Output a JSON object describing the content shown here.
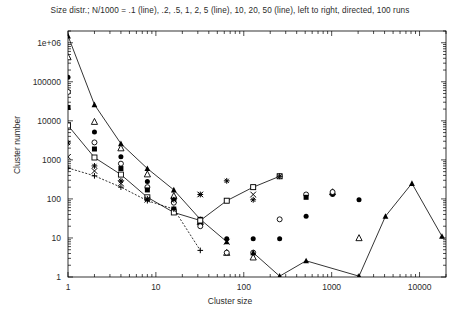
{
  "chart_data": {
    "type": "scatter",
    "title": "Size distr.; N/1000 = .1 (line), .2, .5, 1, 2, 5 (line), 10, 20, 50 (line), left to right, directed, 100 runs",
    "xlabel": "Cluster size",
    "ylabel": "Cluster number",
    "xscale": "log",
    "yscale": "log",
    "xlim": [
      1,
      20000
    ],
    "ylim": [
      1,
      2000000
    ],
    "xticks": [
      "1",
      "10",
      "100",
      "1000",
      "10000"
    ],
    "xtick_values": [
      1,
      10,
      100,
      1000,
      10000
    ],
    "yticks": [
      "1",
      "10",
      "100",
      "1000",
      "10000",
      "100000",
      "1e+06"
    ],
    "ytick_values": [
      1,
      10,
      100,
      1000,
      10000,
      100000,
      1000000
    ],
    "grid": false,
    "legend": "none",
    "note": "9 series; N/1000 = .1, .2, .5, 1, 2, 5, 10, 20, 50; series .1, 5 and 50 are drawn with connecting lines",
    "series": [
      {
        "name": ".1",
        "label": "N/1000 = .1",
        "marker": "filled-triangle",
        "line": true,
        "linestyle": "solid",
        "x": [
          1,
          2,
          4,
          8,
          16,
          32,
          64
        ],
        "y": [
          1500000,
          26000,
          2600,
          600,
          170,
          30,
          8
        ]
      },
      {
        "name": ".2",
        "label": "N/1000 = .2",
        "marker": "open-triangle",
        "line": false,
        "x": [
          1,
          2,
          4,
          8,
          16,
          32,
          64,
          128,
          1024,
          2048
        ],
        "y": [
          430000,
          9500,
          2000,
          430,
          120,
          26,
          4.2,
          3.2,
          150,
          10
        ]
      },
      {
        "name": ".5",
        "label": "N/1000 = .5",
        "marker": "filled-circle",
        "line": false,
        "x": [
          1,
          2,
          4,
          8,
          16,
          32,
          64,
          128,
          256,
          512,
          1024,
          2048
        ],
        "y": [
          130000,
          5200,
          1200,
          280,
          95,
          22,
          9.5,
          9.5,
          9.5,
          36,
          130,
          95
        ]
      },
      {
        "name": "1",
        "label": "N/1000 = 1",
        "marker": "open-circle",
        "line": false,
        "x": [
          1,
          2,
          4,
          8,
          16,
          32,
          64,
          128,
          256,
          512,
          1024
        ],
        "y": [
          55000,
          2800,
          800,
          200,
          80,
          20,
          4.2,
          4.2,
          30,
          130,
          150
        ]
      },
      {
        "name": "2",
        "label": "N/1000 = 2",
        "marker": "filled-square",
        "line": false,
        "x": [
          1,
          2,
          4,
          8,
          16,
          32,
          64,
          128,
          256,
          512
        ],
        "y": [
          22000,
          1900,
          600,
          170,
          55,
          30,
          90,
          200,
          380,
          110
        ]
      },
      {
        "name": "5",
        "label": "N/1000 = 5",
        "marker": "open-square",
        "line": true,
        "linestyle": "solid",
        "x": [
          1,
          2,
          4,
          8,
          16,
          32,
          64,
          128,
          256
        ],
        "y": [
          7600,
          1150,
          420,
          110,
          45,
          28,
          90,
          200,
          380
        ]
      },
      {
        "name": "10",
        "label": "N/1000 = 10",
        "marker": "star",
        "line": false,
        "x": [
          1,
          2,
          4,
          8,
          16,
          32,
          64,
          128,
          256
        ],
        "y": [
          2700,
          700,
          290,
          100,
          95,
          130,
          290,
          95,
          380
        ]
      },
      {
        "name": "20",
        "label": "N/1000 = 20",
        "marker": "cross",
        "line": false,
        "x": [
          1,
          2,
          4,
          8,
          16,
          32,
          64,
          128
        ],
        "y": [
          1200,
          520,
          250,
          95,
          95,
          130,
          8,
          130
        ]
      },
      {
        "name": "50",
        "label": "N/1000 = 50",
        "marker": "plus",
        "line": true,
        "linestyle": "dashed",
        "x": [
          1,
          2,
          4,
          8,
          16,
          32
        ],
        "y": [
          620,
          390,
          200,
          90,
          55,
          4.8
        ]
      },
      {
        "name": "50-line",
        "label": "N/1000 = 50 (tail)",
        "marker": "filled-triangle",
        "line": true,
        "linestyle": "solid",
        "x": [
          128,
          256,
          512,
          2048,
          4096,
          8192,
          18000
        ],
        "y": [
          4.2,
          1.05,
          2.6,
          1.05,
          36,
          250,
          11
        ]
      }
    ]
  }
}
